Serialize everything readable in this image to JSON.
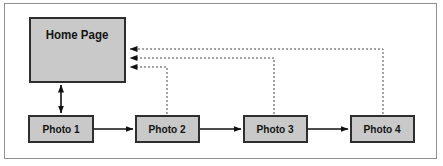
{
  "diagram": {
    "nodes": {
      "home": {
        "label": "Home Page"
      },
      "photo1": {
        "label": "Photo 1"
      },
      "photo2": {
        "label": "Photo 2"
      },
      "photo3": {
        "label": "Photo 3"
      },
      "photo4": {
        "label": "Photo 4"
      }
    },
    "edges": [
      {
        "from": "home",
        "to": "photo1",
        "style": "solid",
        "bidirectional": true
      },
      {
        "from": "photo1",
        "to": "photo2",
        "style": "solid",
        "bidirectional": false
      },
      {
        "from": "photo2",
        "to": "photo3",
        "style": "solid",
        "bidirectional": false
      },
      {
        "from": "photo3",
        "to": "photo4",
        "style": "solid",
        "bidirectional": false
      },
      {
        "from": "photo2",
        "to": "home",
        "style": "dotted",
        "bidirectional": false
      },
      {
        "from": "photo3",
        "to": "home",
        "style": "dotted",
        "bidirectional": false
      },
      {
        "from": "photo4",
        "to": "home",
        "style": "dotted",
        "bidirectional": false
      }
    ],
    "colors": {
      "background": "#ffffff",
      "frame_border": "#8f8f8f",
      "box_fill": "#c9c9c9",
      "box_border": "#2e2e2e",
      "solid_arrow": "#111111",
      "dotted_arrow": "#4a4a4a",
      "text": "#141414"
    }
  }
}
